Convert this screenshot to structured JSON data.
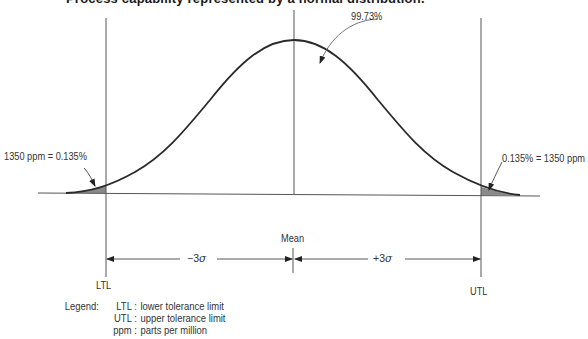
{
  "title": "Process capability represented by a normal distribution.",
  "annotations": {
    "center_area": "99.73%",
    "left_tail": "1350 ppm = 0.135%",
    "right_tail": "0.135% = 1350 ppm",
    "mean_label": "Mean",
    "ltl_label": "LTL",
    "utl_label": "UTL",
    "minus_sigma_prefix": "−3",
    "plus_sigma_prefix": "+3",
    "sigma_symbol": "σ"
  },
  "legend": {
    "heading": "Legend:",
    "items": [
      {
        "key": "LTL :",
        "value": "lower tolerance limit"
      },
      {
        "key": "UTL :",
        "value": "upper tolerance limit"
      },
      {
        "key": "ppm :",
        "value": "parts per million"
      }
    ]
  },
  "colors": {
    "line": "#2a2a2a",
    "thin_line": "#555555",
    "tail_fill": "#8a8a8a"
  }
}
